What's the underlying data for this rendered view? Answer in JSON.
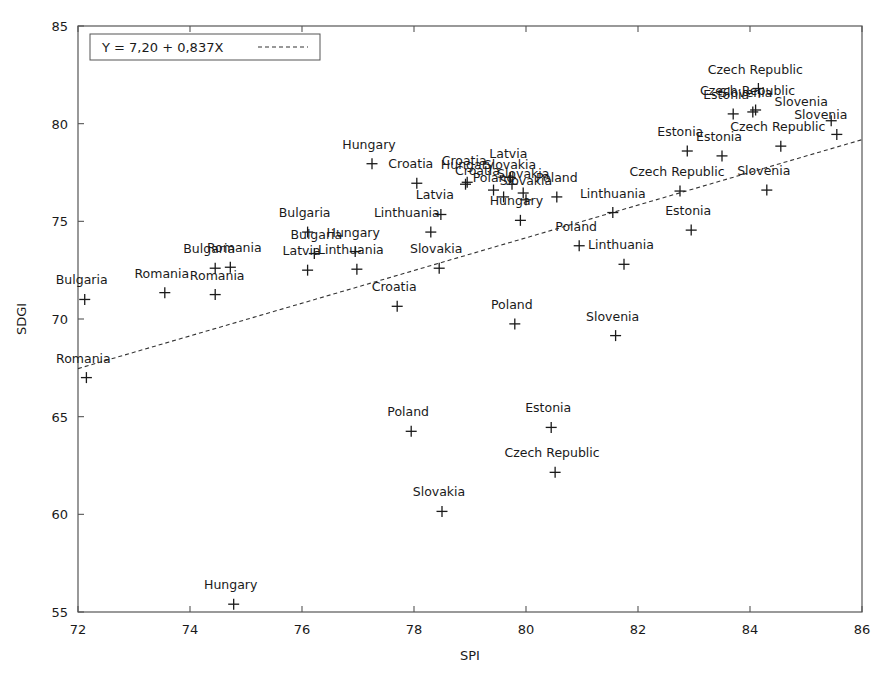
{
  "chart_data": {
    "type": "scatter",
    "title": "",
    "xlabel": "SPI",
    "ylabel": "SDGI",
    "xlim": [
      72,
      86
    ],
    "ylim": [
      55,
      85
    ],
    "xticks": [
      72,
      74,
      76,
      78,
      80,
      82,
      84,
      86
    ],
    "yticks": [
      55,
      60,
      65,
      70,
      75,
      80,
      85
    ],
    "grid": false,
    "legend_position": "top-left",
    "marker": "plus",
    "fit_line": {
      "label": "Y = 7,20 + 0,837X",
      "intercept": 7.2,
      "slope": 0.837,
      "style": "dashed",
      "x_start": 72,
      "x_end": 86,
      "y_start": 67.46,
      "y_end": 79.18
    },
    "points": [
      {
        "label": "Bulgaria",
        "x": 72.12,
        "y": 71.0,
        "lx": -3,
        "ly": -15
      },
      {
        "label": "Romania",
        "x": 72.15,
        "y": 67.0,
        "lx": -3,
        "ly": -15
      },
      {
        "label": "Romania",
        "x": 73.55,
        "y": 71.35,
        "lx": -3,
        "ly": -15
      },
      {
        "label": "Bulgaria",
        "x": 74.45,
        "y": 72.6,
        "lx": -6,
        "ly": -15
      },
      {
        "label": "Romania",
        "x": 74.45,
        "y": 71.25,
        "lx": 2,
        "ly": -15
      },
      {
        "label": "Romania",
        "x": 74.72,
        "y": 72.65,
        "lx": 4,
        "ly": -15
      },
      {
        "label": "Hungary",
        "x": 74.78,
        "y": 55.4,
        "lx": -3,
        "ly": -15
      },
      {
        "label": "Bulgaria",
        "x": 76.1,
        "y": 74.45,
        "lx": -3,
        "ly": -15
      },
      {
        "label": "Latvia",
        "x": 76.1,
        "y": 72.5,
        "lx": -6,
        "ly": -15
      },
      {
        "label": "Bulgaria",
        "x": 76.22,
        "y": 73.35,
        "lx": 2,
        "ly": -15
      },
      {
        "label": "Hungary",
        "x": 76.95,
        "y": 73.45,
        "lx": -2,
        "ly": -15
      },
      {
        "label": "Linthuania",
        "x": 76.98,
        "y": 72.55,
        "lx": -6,
        "ly": -15
      },
      {
        "label": "Hungary",
        "x": 77.25,
        "y": 77.95,
        "lx": -3,
        "ly": -15
      },
      {
        "label": "Croatia",
        "x": 77.7,
        "y": 70.65,
        "lx": -3,
        "ly": -15
      },
      {
        "label": "Croatia",
        "x": 78.05,
        "y": 76.95,
        "lx": -6,
        "ly": -15
      },
      {
        "label": "Linthuania",
        "x": 78.3,
        "y": 74.45,
        "lx": -24,
        "ly": -15
      },
      {
        "label": "Slovakia",
        "x": 78.45,
        "y": 72.6,
        "lx": -3,
        "ly": -15
      },
      {
        "label": "Latvia",
        "x": 78.48,
        "y": 75.35,
        "lx": -6,
        "ly": -15
      },
      {
        "label": "Poland",
        "x": 77.95,
        "y": 64.25,
        "lx": -3,
        "ly": -15
      },
      {
        "label": "Slovakia",
        "x": 78.5,
        "y": 60.15,
        "lx": -3,
        "ly": -15
      },
      {
        "label": "Croatia",
        "x": 78.95,
        "y": 77.0,
        "lx": -3,
        "ly": -17
      },
      {
        "label": "Hungary",
        "x": 78.92,
        "y": 76.9,
        "lx": 2,
        "ly": -15
      },
      {
        "label": "Croatia",
        "x": 79.42,
        "y": 76.6,
        "lx": -16,
        "ly": -15
      },
      {
        "label": "Latvia",
        "x": 79.72,
        "y": 77.25,
        "lx": -2,
        "ly": -19
      },
      {
        "label": "Slovakia",
        "x": 79.75,
        "y": 76.9,
        "lx": -2,
        "ly": -15
      },
      {
        "label": "Poland",
        "x": 79.6,
        "y": 76.25,
        "lx": -10,
        "ly": -15
      },
      {
        "label": "Slovakia",
        "x": 79.95,
        "y": 76.45,
        "lx": 0,
        "ly": -15
      },
      {
        "label": "Slovakia",
        "x": 80.0,
        "y": 76.1,
        "lx": 0,
        "ly": -15
      },
      {
        "label": "Hungary",
        "x": 79.9,
        "y": 75.05,
        "lx": -4,
        "ly": -15
      },
      {
        "label": "Poland",
        "x": 80.55,
        "y": 76.25,
        "lx": 0,
        "ly": -15
      },
      {
        "label": "Poland",
        "x": 79.8,
        "y": 69.75,
        "lx": -3,
        "ly": -15
      },
      {
        "label": "Estonia",
        "x": 80.45,
        "y": 64.45,
        "lx": -3,
        "ly": -15
      },
      {
        "label": "Czech Republic",
        "x": 80.52,
        "y": 62.15,
        "lx": -3,
        "ly": -15
      },
      {
        "label": "Poland",
        "x": 80.95,
        "y": 73.75,
        "lx": -3,
        "ly": -15
      },
      {
        "label": "Linthuania",
        "x": 81.55,
        "y": 75.45,
        "lx": 0,
        "ly": -15
      },
      {
        "label": "Linthuania",
        "x": 81.75,
        "y": 72.8,
        "lx": -3,
        "ly": -15
      },
      {
        "label": "Slovenia",
        "x": 81.6,
        "y": 69.15,
        "lx": -3,
        "ly": -15
      },
      {
        "label": "Czech Republic",
        "x": 82.75,
        "y": 76.55,
        "lx": -3,
        "ly": -15
      },
      {
        "label": "Estonia",
        "x": 82.95,
        "y": 74.55,
        "lx": -3,
        "ly": -15
      },
      {
        "label": "Estonia",
        "x": 82.88,
        "y": 78.6,
        "lx": -7,
        "ly": -15
      },
      {
        "label": "Estonia",
        "x": 83.5,
        "y": 78.35,
        "lx": -3,
        "ly": -15
      },
      {
        "label": "Estonia",
        "x": 83.7,
        "y": 80.5,
        "lx": -7,
        "ly": -15
      },
      {
        "label": "Slovenia",
        "x": 84.05,
        "y": 80.6,
        "lx": -7,
        "ly": -15
      },
      {
        "label": "Czech Republic",
        "x": 84.1,
        "y": 80.7,
        "lx": -8,
        "ly": -15
      },
      {
        "label": "Czech Republic",
        "x": 84.15,
        "y": 81.8,
        "lx": -3,
        "ly": -15
      },
      {
        "label": "Slovenia",
        "x": 84.3,
        "y": 76.6,
        "lx": -3,
        "ly": -15
      },
      {
        "label": "Czech Republic",
        "x": 84.55,
        "y": 78.85,
        "lx": -3,
        "ly": -15
      },
      {
        "label": "Slovenia",
        "x": 85.45,
        "y": 80.15,
        "lx": -30,
        "ly": -15
      },
      {
        "label": "Slovenia",
        "x": 85.55,
        "y": 79.45,
        "lx": -16,
        "ly": -15
      }
    ]
  }
}
